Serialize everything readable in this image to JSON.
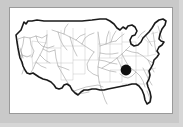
{
  "figure": {
    "panel_background": "#ffffff",
    "outer_background": "#c9c9c9",
    "border_color": "#9a9a9a"
  },
  "map": {
    "region_label": "Contiguous United States",
    "outline_color": "#1a1a1a",
    "outline_width": "1.6",
    "river_color": "#8c8c8c",
    "river_width": "0.5",
    "state_border_color": "#b8b8b8",
    "state_border_width": "0.4"
  },
  "marker": {
    "name": "location-dot",
    "label": "",
    "color": "#111111",
    "cx": 116,
    "cy": 62,
    "r": 5.4
  },
  "chart_data": {
    "type": "map",
    "projection": "albers-like",
    "layers": [
      {
        "name": "national-outline",
        "style": "thick black stroke, white fill"
      },
      {
        "name": "state-boundaries",
        "style": "thin light gray stroke"
      },
      {
        "name": "rivers",
        "style": "thin gray polylines"
      },
      {
        "name": "site-marker",
        "style": "filled black circle"
      }
    ],
    "markers": [
      {
        "id": "site-1",
        "x": 116,
        "y": 62,
        "radius": 5.4,
        "color": "#111111",
        "approx_region": "Tennessee / northern Alabama"
      }
    ],
    "legend": {
      "visible": false,
      "entries": []
    },
    "axes": {
      "visible": false
    },
    "grid": false
  }
}
